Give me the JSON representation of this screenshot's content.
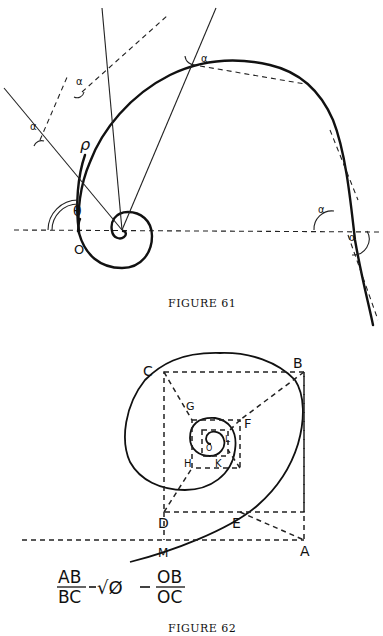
{
  "figure61": {
    "caption": "Figure 61",
    "caption_display": "FIGURE 61",
    "labels": {
      "origin": "O",
      "theta": "θ",
      "rho": "ρ",
      "alpha": "α"
    }
  },
  "figure62": {
    "caption": "Figure 62",
    "caption_display": "FIGURE 62",
    "points": {
      "A": "A",
      "B": "B",
      "C": "C",
      "D": "D",
      "E": "E",
      "F": "F",
      "G": "G",
      "H": "H",
      "K": "K",
      "L": "L",
      "M": "M",
      "O": "O"
    },
    "formula": {
      "lhs_num": "AB",
      "lhs_den": "BC",
      "middle": "√Ø",
      "rhs_num": "OB",
      "rhs_den": "OC",
      "sep": "="
    }
  }
}
